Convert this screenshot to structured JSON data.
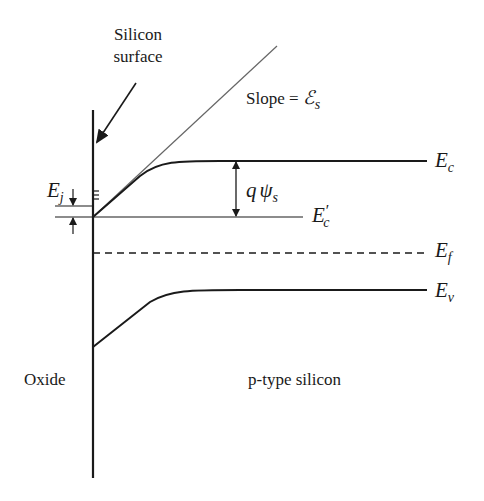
{
  "diagram": {
    "colors": {
      "line": "#1a1a1a",
      "tangent": "#666666",
      "background": "#ffffff"
    },
    "labels": {
      "silicon_surface_line1": "Silicon",
      "silicon_surface_line2": "surface",
      "slope_text": "Slope = ",
      "slope_symbol": "ℰ",
      "slope_sub": "s",
      "ec_main": "E",
      "ec_sub": "c",
      "ec_prime_main": "E",
      "ec_prime_sub": "c",
      "ec_prime_mark": "′",
      "ef_main": "E",
      "ef_sub": "f",
      "ev_main": "E",
      "ev_sub": "v",
      "ej_main": "E",
      "ej_sub": "j",
      "qpsi_q": "q",
      "qpsi_psi": "ψ",
      "qpsi_sub": "s",
      "oxide": "Oxide",
      "p_type": "p-type silicon"
    },
    "geometry": {
      "interface_x": 93,
      "interface_y_top": 110,
      "interface_y_bottom": 478,
      "ec_surface_y": 217,
      "ec_bulk_y": 161,
      "ec_prime_y": 217,
      "ef_y": 253,
      "ev_surface_y": 347,
      "ev_bulk_y": 290,
      "band_end_x": 427,
      "tangent_end": [
        277,
        46
      ],
      "qpsi_arrow_x": 236
    },
    "annotations": [
      {
        "name": "silicon-surface-arrow",
        "from": [
          136,
          83
        ],
        "to": [
          95,
          145
        ]
      },
      {
        "name": "ej-quantized-levels",
        "count": 3
      }
    ]
  }
}
